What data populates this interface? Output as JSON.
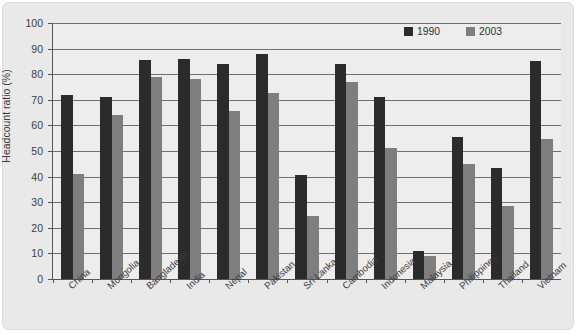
{
  "chart_data": {
    "type": "bar",
    "title": "",
    "xlabel": "",
    "ylabel": "Headcount ratio (%)",
    "ylim": [
      0,
      100
    ],
    "ytick_step": 10,
    "yticks": [
      0,
      10,
      20,
      30,
      40,
      50,
      60,
      70,
      80,
      90,
      100
    ],
    "grid": true,
    "legend_position": "top-right",
    "categories": [
      "China",
      "Mongolia",
      "Bangladesh",
      "India",
      "Nepal",
      "Pakistan",
      "Sri Lanka",
      "Cambodia",
      "Indonesia",
      "Malaysia",
      "Philippines",
      "Thailand",
      "Vietnam"
    ],
    "series": [
      {
        "name": "1990",
        "color": "#2b2b2b",
        "values": [
          72,
          71,
          85.5,
          86,
          84,
          88,
          40.5,
          84,
          71,
          11,
          55.5,
          43.5,
          85
        ]
      },
      {
        "name": "2003",
        "color": "#7e7e7e",
        "values": [
          41,
          64,
          79,
          78,
          65.5,
          72.5,
          24.5,
          77,
          51,
          9,
          45,
          28.5,
          54.5
        ]
      }
    ]
  },
  "legend": {
    "items": [
      {
        "label": "1990",
        "color": "#2b2b2b"
      },
      {
        "label": "2003",
        "color": "#7e7e7e"
      }
    ]
  },
  "colors": {
    "series_1990": "#2b2b2b",
    "series_2003": "#7e7e7e",
    "plot_background": "#ededed",
    "card_background": "#e9e9e9",
    "axis": "#55565a",
    "gridline": "#6e7074"
  }
}
